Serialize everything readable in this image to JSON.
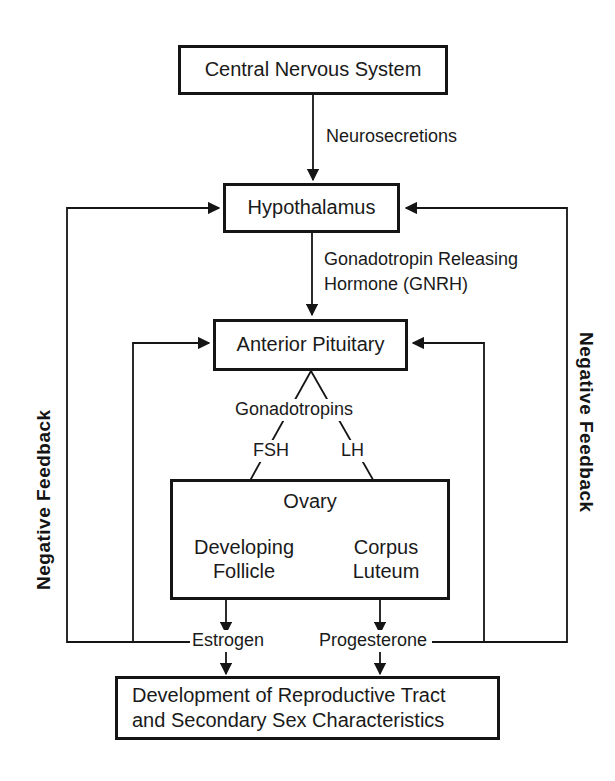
{
  "diagram": {
    "type": "flowchart",
    "colors": {
      "stroke": "#151515",
      "text": "#1a1a1a",
      "background": "#ffffff"
    },
    "nodes": {
      "cns": "Central Nervous System",
      "hypothalamus": "Hypothalamus",
      "pituitary": "Anterior Pituitary",
      "ovary": "Ovary",
      "follicle": "Developing\nFollicle",
      "corpus_luteum": "Corpus\nLuteum",
      "development": "Development of Reproductive Tract\nand Secondary Sex Characteristics",
      "development_line1": "Development of Reproductive Tract",
      "development_line2": "and Secondary Sex Characteristics"
    },
    "edge_labels": {
      "neurosecretions": "Neurosecretions",
      "gnrh_line1": "Gonadotropin Releasing",
      "gnrh_line2": "Hormone (GNRH)",
      "gonadotropins": "Gonadotropins",
      "fsh": "FSH",
      "lh": "LH",
      "estrogen": "Estrogen",
      "progesterone": "Progesterone"
    },
    "feedback": {
      "left": "Negative  Feedback",
      "right": "Negative  Feedback"
    }
  }
}
